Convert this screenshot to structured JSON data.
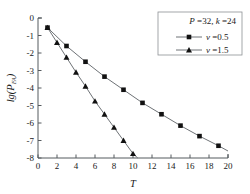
{
  "chart_data": {
    "type": "line",
    "title": "",
    "xlabel": "T",
    "ylabel": "lg(P_FA)",
    "ylabel_parts": {
      "prefix": "lg(",
      "italic_symbol": "P",
      "subscript": "FA",
      "suffix": ")"
    },
    "xlim": [
      0,
      20
    ],
    "ylim": [
      -8,
      0
    ],
    "xticks": [
      0,
      2,
      4,
      6,
      8,
      10,
      12,
      14,
      16,
      18,
      20
    ],
    "xtick_labels": [
      "0",
      "2",
      "4",
      "6",
      "8",
      "10",
      "12",
      "14",
      "16",
      "18",
      "20"
    ],
    "yticks": [
      0,
      -1,
      -2,
      -3,
      -4,
      -5,
      -6,
      -7,
      -8
    ],
    "ytick_labels": [
      "0",
      "-1",
      "-2",
      "-3",
      "-4",
      "-5",
      "-6",
      "-7",
      "-8"
    ],
    "grid": false,
    "legend_position": "upper right",
    "annotation": "P =32, k =24",
    "annotation_parts": {
      "p_symbol": "P",
      "p_value": "=32,",
      "k_symbol": "k",
      "k_value": "=24"
    },
    "series": [
      {
        "name": "v =0.5",
        "marker": "square",
        "legend_symbol": "v",
        "legend_value": "=0.5",
        "x": [
          1,
          3,
          5,
          7,
          9,
          11,
          13,
          15,
          17,
          19
        ],
        "values": [
          -0.55,
          -1.6,
          -2.5,
          -3.35,
          -4.1,
          -4.85,
          -5.5,
          -6.15,
          -6.75,
          -7.3
        ],
        "line_end_x": 20,
        "line_end_y": -7.6
      },
      {
        "name": "v =1.5",
        "marker": "triangle",
        "legend_symbol": "v",
        "legend_value": "=1.5",
        "x": [
          1,
          2,
          3,
          4,
          5,
          6,
          7,
          8,
          9,
          10
        ],
        "values": [
          -0.55,
          -1.4,
          -2.25,
          -3.1,
          -3.9,
          -4.75,
          -5.5,
          -6.25,
          -7.0,
          -7.75
        ],
        "line_end_x": 10.5,
        "line_end_y": -8.0
      }
    ]
  }
}
